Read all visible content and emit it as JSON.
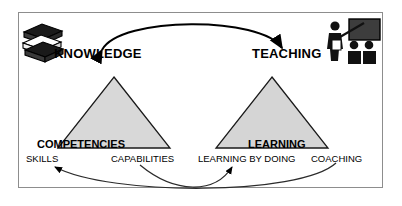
{
  "diagram": {
    "title_nodes": {
      "knowledge": "KNOWLEDGE",
      "teaching": "TEACHING"
    },
    "triangles": [
      {
        "name": "competencies",
        "label": "COMPETENCIES",
        "fill": "#d8d8d8",
        "stroke": "#1a1a1a"
      },
      {
        "name": "learning",
        "label": "LEARNING",
        "fill": "#d5d5d5",
        "stroke": "#1a1a1a"
      }
    ],
    "base_labels": [
      {
        "name": "skills",
        "label": "SKILLS"
      },
      {
        "name": "capabilities",
        "label": "CAPABILITIES"
      },
      {
        "name": "learning-by-doing",
        "label": "LEARNING BY DOING"
      },
      {
        "name": "coaching",
        "label": "COACHING"
      }
    ],
    "icons": [
      {
        "name": "books-icon",
        "meaning": "stack-of-books"
      },
      {
        "name": "teaching-icon",
        "meaning": "teacher-at-blackboard-with-students"
      }
    ],
    "connectors": [
      {
        "name": "knowledge-teaching-arc",
        "from": "KNOWLEDGE",
        "to": "TEACHING",
        "style": "double-headed-arc"
      },
      {
        "name": "coaching-to-skills-arc",
        "from": "COACHING",
        "to": "SKILLS",
        "style": "curved-arrow"
      },
      {
        "name": "capabilities-to-learning-by-doing-arc",
        "from": "CAPABILITIES",
        "to": "LEARNING BY DOING",
        "style": "curved-arrow"
      }
    ],
    "colors": {
      "frame_border": "#8d8d8d",
      "ink": "#000000",
      "triangle_fill": "#d8d8d8",
      "background": "#ffffff"
    }
  }
}
